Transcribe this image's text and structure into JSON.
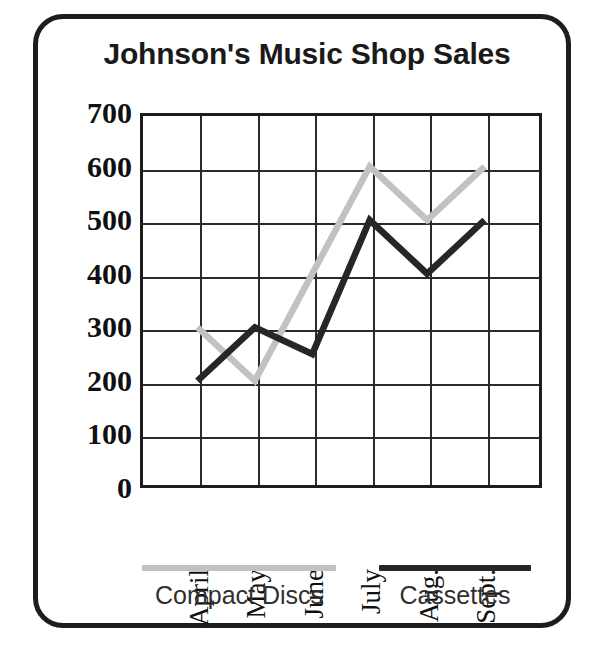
{
  "chart_data": {
    "type": "line",
    "title": "Johnson's Music Shop Sales",
    "xlabel": "",
    "ylabel": "",
    "categories": [
      "April",
      "May",
      "June",
      "July",
      "Aug.",
      "Sept."
    ],
    "ylim": [
      0,
      700
    ],
    "ytick_step": 100,
    "yticks": [
      "700",
      "600",
      "500",
      "400",
      "300",
      "200",
      "100",
      "0"
    ],
    "grid": true,
    "legend_position": "bottom",
    "series": [
      {
        "name": "Compact Discs",
        "color": "#c2c2c2",
        "values": [
          300,
          200,
          400,
          600,
          500,
          600
        ],
        "vertex_at_june": false
      },
      {
        "name": "Cassettes",
        "color": "#262626",
        "values": [
          200,
          300,
          250,
          500,
          400,
          500
        ],
        "vertex_at_june": true
      }
    ]
  },
  "legend": {
    "entries": [
      {
        "label": "Compact Discs",
        "swatch_color": "#c2c2c2"
      },
      {
        "label": "Cassettes",
        "swatch_color": "#262626"
      }
    ]
  },
  "colors": {
    "frame": "#1d1d1d",
    "grid": "#2b2b2b",
    "text": "#101010",
    "compact_discs": "#c2c2c2",
    "cassettes": "#262626"
  }
}
